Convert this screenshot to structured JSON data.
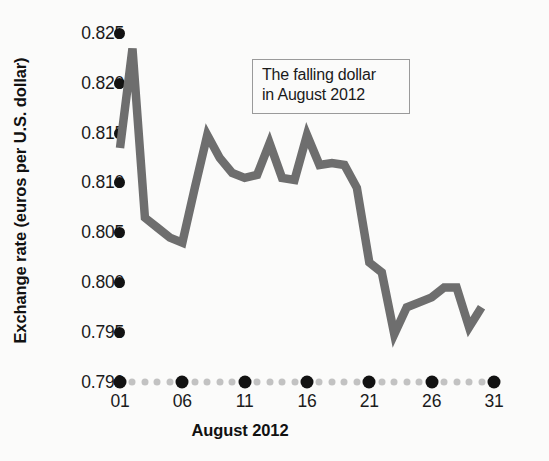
{
  "chart_data": {
    "type": "line",
    "title": "",
    "annotation": "The falling dollar in August 2012",
    "annotation_line1": "The falling dollar",
    "annotation_line2": "in August 2012",
    "xlabel": "August 2012",
    "ylabel": "Exchange rate (euros per U.S. dollar)",
    "ylim": [
      0.79,
      0.825
    ],
    "xlim": [
      1,
      31
    ],
    "grid": false,
    "legend": "none",
    "line_color": "#6e6e6e",
    "tick_color": "#121212",
    "minor_tick_color": "#c2c2c2",
    "y_ticks": [
      "0.825",
      "0.820",
      "0.815",
      "0.810",
      "0.805",
      "0.800",
      "0.795",
      "0.790"
    ],
    "y_tick_values": [
      0.825,
      0.82,
      0.815,
      0.81,
      0.805,
      0.8,
      0.795,
      0.79
    ],
    "x_ticks": [
      "01",
      "06",
      "11",
      "16",
      "21",
      "26",
      "31"
    ],
    "x_tick_values": [
      1,
      6,
      11,
      16,
      21,
      26,
      31
    ],
    "x": [
      1,
      2,
      3,
      4,
      5,
      6,
      7,
      8,
      9,
      10,
      11,
      12,
      13,
      14,
      15,
      16,
      17,
      18,
      19,
      20,
      21,
      22,
      23,
      24,
      25,
      26,
      27,
      28,
      29,
      30
    ],
    "values": [
      0.8135,
      0.8235,
      0.8065,
      0.8055,
      0.8045,
      0.804,
      0.8095,
      0.8148,
      0.8125,
      0.811,
      0.8105,
      0.8108,
      0.814,
      0.8105,
      0.8103,
      0.8148,
      0.8118,
      0.812,
      0.8118,
      0.8095,
      0.802,
      0.801,
      0.7948,
      0.7975,
      0.798,
      0.7985,
      0.7995,
      0.7995,
      0.7955,
      0.7975
    ],
    "series": [
      {
        "name": "Exchange rate",
        "values": [
          0.8135,
          0.8235,
          0.8065,
          0.8055,
          0.8045,
          0.804,
          0.8095,
          0.8148,
          0.8125,
          0.811,
          0.8105,
          0.8108,
          0.814,
          0.8105,
          0.8103,
          0.8148,
          0.8118,
          0.812,
          0.8118,
          0.8095,
          0.802,
          0.801,
          0.7948,
          0.7975,
          0.798,
          0.7985,
          0.7995,
          0.7995,
          0.7955,
          0.7975
        ]
      }
    ]
  }
}
